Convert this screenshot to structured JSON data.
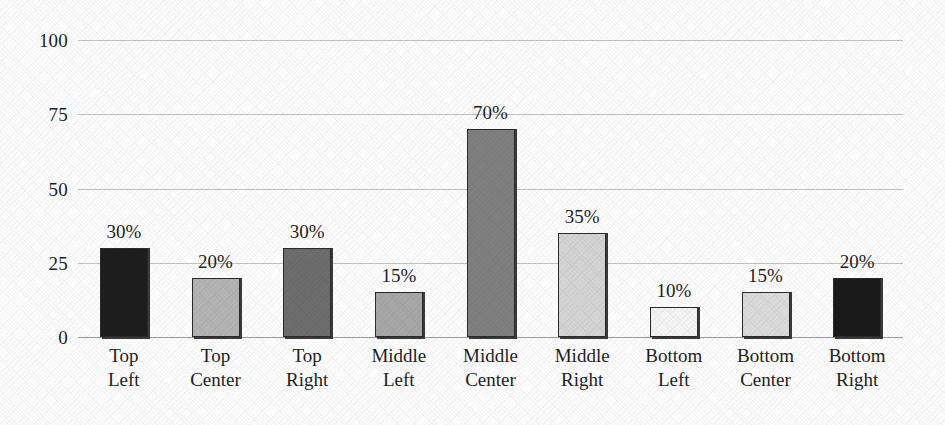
{
  "chart_data": {
    "type": "bar",
    "title": "",
    "subtitle": "",
    "xlabel": "",
    "ylabel": "",
    "ylim": [
      0,
      100
    ],
    "yticks": [
      0,
      25,
      50,
      75,
      100
    ],
    "ytick_labels": [
      "0",
      "25",
      "50",
      "75",
      "100"
    ],
    "grid": true,
    "legend": "none",
    "categories": [
      "Top Left",
      "Top Center",
      "Top Right",
      "Middle Left",
      "Middle Center",
      "Middle Right",
      "Bottom Left",
      "Bottom Center",
      "Bottom Right"
    ],
    "category_lines": [
      [
        "Top",
        "Left"
      ],
      [
        "Top",
        "Center"
      ],
      [
        "Top",
        "Right"
      ],
      [
        "Middle",
        "Left"
      ],
      [
        "Middle",
        "Center"
      ],
      [
        "Middle",
        "Right"
      ],
      [
        "Bottom",
        "Left"
      ],
      [
        "Bottom",
        "Center"
      ],
      [
        "Bottom",
        "Right"
      ]
    ],
    "values": [
      30,
      20,
      30,
      15,
      70,
      35,
      10,
      15,
      20
    ],
    "data_labels": [
      "30%",
      "20%",
      "30%",
      "15%",
      "70%",
      "35%",
      "10%",
      "15%",
      "20%"
    ],
    "bar_colors": [
      "#1e1e1e",
      "#b5b5b5",
      "#6e6e6e",
      "#a8a8a8",
      "#808080",
      "#d5d5d5",
      "#f5f5f5",
      "#dcdcdc",
      "#1a1a1a"
    ],
    "bar_border_color": "#2b2b2b",
    "gridline_color": "#b9b9b9",
    "background_color": "#fefefe",
    "text_color": "#1f1f1f"
  }
}
